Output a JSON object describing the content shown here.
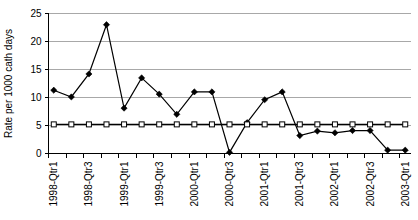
{
  "chart_data": {
    "type": "line",
    "title": "",
    "xlabel": "",
    "ylabel": "Rate per 1000 cath days",
    "ylim": [
      0,
      25
    ],
    "yticks": [
      0,
      5,
      10,
      15,
      20,
      25
    ],
    "ytick_labels": [
      "0",
      "5",
      "10",
      "15",
      "20",
      "25"
    ],
    "grid": true,
    "legend_position": "none",
    "categories": [
      "1998-Qtr1",
      "1998-Qtr2",
      "1998-Qtr3",
      "1998-Qtr4",
      "1999-Qtr1",
      "1999-Qtr2",
      "1999-Qtr3",
      "1999-Qtr4",
      "2000-Qtr1",
      "2000-Qtr2",
      "2000-Qtr3",
      "2000-Qtr4",
      "2001-Qtr1",
      "2001-Qtr2",
      "2001-Qtr3",
      "2001-Qtr4",
      "2002-Qtr1",
      "2002-Qtr2",
      "2002-Qtr3",
      "2002-Qtr4",
      "2003-Qtr1"
    ],
    "xtick_labels_visible": [
      "1998-Qtr1",
      "",
      "1998-Qtr3",
      "",
      "1999-Qtr1",
      "",
      "1999-Qtr3",
      "",
      "2000-Qtr1",
      "",
      "2000-Qtr3",
      "",
      "2001-Qtr1",
      "",
      "2001-Qtr3",
      "",
      "2002-Qtr1",
      "",
      "2002-Qtr3",
      "",
      "2003-Qtr1"
    ],
    "series": [
      {
        "name": "Observed rate",
        "marker": "diamond",
        "color": "#000000",
        "values": [
          11.3,
          10.1,
          14.2,
          23.0,
          8.1,
          13.5,
          10.6,
          7.0,
          11.0,
          11.0,
          0.2,
          5.5,
          9.6,
          11.0,
          3.2,
          4.0,
          3.7,
          4.1,
          4.1,
          0.6,
          0.6
        ]
      },
      {
        "name": "Benchmark rate",
        "marker": "square",
        "color": "#000000",
        "values": [
          5.2,
          5.2,
          5.2,
          5.2,
          5.2,
          5.2,
          5.2,
          5.2,
          5.2,
          5.2,
          5.2,
          5.2,
          5.2,
          5.2,
          5.2,
          5.2,
          5.2,
          5.2,
          5.2,
          5.2,
          5.2
        ]
      }
    ]
  }
}
